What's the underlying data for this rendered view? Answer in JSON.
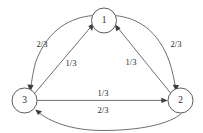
{
  "diagram": {
    "type": "state-transition-diagram",
    "title": "",
    "nodes": [
      {
        "id": "1",
        "label": "1",
        "cx": 104,
        "cy": 20.5,
        "r": 12.5
      },
      {
        "id": "3",
        "label": "3",
        "cx": 24.5,
        "cy": 100.5,
        "r": 12.5
      },
      {
        "id": "2",
        "label": "2",
        "cx": 180.5,
        "cy": 100.5,
        "r": 12.5
      }
    ],
    "edges": [
      {
        "id": "edge-1-to-3",
        "from": "1",
        "to": "3",
        "label": "2/3",
        "shape": "curved",
        "label_x": 42,
        "label_y": 45.5
      },
      {
        "id": "edge-3-to-1",
        "from": "3",
        "to": "1",
        "label": "1/3",
        "shape": "straight",
        "label_x": 71,
        "label_y": 64.5
      },
      {
        "id": "edge-1-to-2",
        "from": "1",
        "to": "2",
        "label": "2/3",
        "shape": "curved",
        "label_x": 176,
        "label_y": 45.5
      },
      {
        "id": "edge-2-to-1",
        "from": "2",
        "to": "1",
        "label": "1/3",
        "shape": "straight",
        "label_x": 131,
        "label_y": 63.5
      },
      {
        "id": "edge-3-to-2",
        "from": "3",
        "to": "2",
        "label": "1/3",
        "shape": "straight",
        "label_x": 103,
        "label_y": 94.5
      },
      {
        "id": "edge-2-to-3",
        "from": "2",
        "to": "3",
        "label": "2/3",
        "shape": "curved",
        "label_x": 103,
        "label_y": 111
      }
    ],
    "colors": {
      "stroke": "#4a4a4a",
      "text": "#2b2b2b",
      "background": "#ffffff",
      "arrow": "#3d3d3d"
    }
  }
}
